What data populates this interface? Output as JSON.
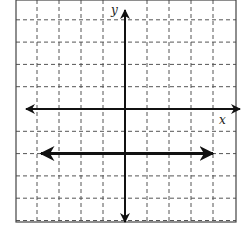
{
  "chart_data": {
    "type": "line",
    "title": "",
    "xlabel": "x",
    "ylabel": "y",
    "xlim": [
      -5,
      5
    ],
    "ylim": [
      -5,
      5
    ],
    "grid": true,
    "grid_style": "dashed",
    "legend": null,
    "tick_labels": false,
    "series": [
      {
        "name": "horizontal line y = -2",
        "equation": "y = -2",
        "x": [
          -4,
          4
        ],
        "y": [
          -2,
          -2
        ],
        "arrows": "both"
      }
    ]
  },
  "axes": {
    "x_label": "x",
    "y_label": "y"
  },
  "colors": {
    "axis": "#111111",
    "line": "#111111",
    "grid": "#555555",
    "border": "#444444",
    "background": "#ffffff"
  }
}
